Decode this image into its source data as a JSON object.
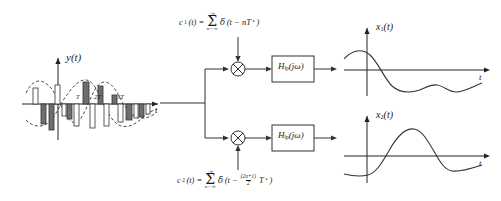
{
  "figure": {
    "background_color": "#ffffff",
    "line_color": "#333333",
    "fill_light": "#ffffff",
    "fill_dark": "#6e6e6e"
  },
  "left_plot": {
    "name": "multiplexed-signal-plot",
    "y_axis_label": "y(t)",
    "y_axis_label_parts": {
      "base": "y",
      "arg": "(t)"
    },
    "x_axis_label": "t",
    "tick_labels": [
      "T",
      "2T",
      "3T"
    ],
    "tick_label_positions_px": [
      78,
      97,
      120
    ],
    "description": "Interleaved PAM sample pulses of two signals, shown as alternating white and grey bars following two dashed sinusoidal envelopes."
  },
  "block_diagram": {
    "name": "demultiplexer-block-diagram",
    "input_label": "",
    "carrier_top": {
      "lhs": "c",
      "lhs_sub": "1",
      "lhs_arg": "(t) =",
      "sum_upper": "+∞",
      "sum_symbol": "Σ",
      "sum_lower": "n=−∞",
      "delta": "δ",
      "body": "(t − nT",
      "body_sup": "*",
      "body_close": ")"
    },
    "carrier_bottom": {
      "lhs": "c",
      "lhs_sub": "2",
      "lhs_arg": "(t) =",
      "sum_upper": "+∞",
      "sum_symbol": "Σ",
      "sum_lower": "n=−∞",
      "delta": "δ",
      "body": "(t − ",
      "frac_num": "(2n+1)",
      "frac_den": "2",
      "body_tail": "T",
      "body_sup": "*",
      "body_close": ")"
    },
    "multiplier_symbol": "⊗",
    "filters": [
      {
        "label_base": "H",
        "label_sub": "lp",
        "label_arg": "(jω)"
      },
      {
        "label_base": "H",
        "label_sub": "lp",
        "label_arg": "(jω)"
      }
    ]
  },
  "right_plots": [
    {
      "name": "output-signal-x1-plot",
      "y_axis_label_base": "x",
      "y_axis_label_sub": "1",
      "y_axis_label_arg": "(t)",
      "x_axis_label": "t",
      "description": "Recovered signal x1(t): starts positive, crosses zero, dips to a negative minimum then oscillates back toward zero."
    },
    {
      "name": "output-signal-x2-plot",
      "y_axis_label_base": "x",
      "y_axis_label_sub": "2",
      "y_axis_label_arg": "(t)",
      "x_axis_label": "t",
      "description": "Recovered signal x2(t): starts negative, rises to a positive peak, falls back below zero and levels off."
    }
  ],
  "chart_data": {
    "type": "line",
    "panels": [
      {
        "id": "y_of_t",
        "type": "bar",
        "title": "y(t)",
        "xlabel": "t",
        "ylabel": "y(t)",
        "grid": false,
        "legend": null,
        "tick_labels": [
          "T",
          "2T",
          "3T"
        ],
        "envelopes": [
          {
            "name": "envelope-1",
            "style": "dashed",
            "values": [
              0.55,
              0.9,
              0.45,
              -0.55,
              -0.85,
              -0.2,
              0.6,
              0.95,
              0.7,
              0.25,
              -0.3,
              -0.6,
              -0.45,
              -0.2,
              0.05,
              0.15
            ]
          },
          {
            "name": "envelope-2",
            "style": "dashed",
            "values": [
              -0.6,
              -0.85,
              -0.7,
              -0.25,
              0.3,
              0.8,
              0.95,
              0.55,
              -0.1,
              -0.6,
              -0.85,
              -0.6,
              -0.25,
              0.0,
              0.1,
              0.05
            ]
          }
        ],
        "bars": [
          {
            "series": "x1",
            "fill": "#ffffff",
            "value": 0.5
          },
          {
            "series": "x2",
            "fill": "#6e6e6e",
            "value": -0.72
          },
          {
            "series": "x1",
            "fill": "#ffffff",
            "value": 0.62
          },
          {
            "series": "x2",
            "fill": "#6e6e6e",
            "value": -0.8
          },
          {
            "series": "x1",
            "fill": "#ffffff",
            "value": -0.28
          },
          {
            "series": "x2",
            "fill": "#6e6e6e",
            "value": -0.4
          },
          {
            "series": "x1",
            "fill": "#ffffff",
            "value": -0.62
          },
          {
            "series": "x2",
            "fill": "#6e6e6e",
            "value": 0.92
          },
          {
            "series": "x1",
            "fill": "#ffffff",
            "value": -0.7
          },
          {
            "series": "x2",
            "fill": "#6e6e6e",
            "value": 0.7
          },
          {
            "series": "x1",
            "fill": "#ffffff",
            "value": -0.58
          },
          {
            "series": "x2",
            "fill": "#6e6e6e",
            "value": 0.28
          },
          {
            "series": "x1",
            "fill": "#ffffff",
            "value": -0.45
          },
          {
            "series": "x2",
            "fill": "#6e6e6e",
            "value": -0.4
          },
          {
            "series": "x1",
            "fill": "#ffffff",
            "value": -0.35
          },
          {
            "series": "x2",
            "fill": "#6e6e6e",
            "value": -0.3
          },
          {
            "series": "x1",
            "fill": "#ffffff",
            "value": -0.22
          }
        ]
      },
      {
        "id": "x1_of_t",
        "type": "line",
        "title": "x1(t)",
        "xlabel": "t",
        "ylabel": "x1(t)",
        "grid": false,
        "x": [
          0,
          1,
          2,
          3,
          4,
          5,
          6,
          7,
          8,
          9,
          10
        ],
        "y": [
          0.35,
          0.55,
          0.45,
          0.0,
          -0.5,
          -0.72,
          -0.62,
          -0.7,
          -0.55,
          -0.5,
          -0.35
        ]
      },
      {
        "id": "x2_of_t",
        "type": "line",
        "title": "x2(t)",
        "xlabel": "t",
        "ylabel": "x2(t)",
        "grid": false,
        "x": [
          0,
          1,
          2,
          3,
          4,
          5,
          6,
          7,
          8,
          9,
          10
        ],
        "y": [
          -0.55,
          -0.55,
          -0.4,
          0.3,
          0.82,
          0.85,
          0.45,
          -0.3,
          -0.48,
          -0.4,
          -0.3
        ]
      }
    ]
  }
}
